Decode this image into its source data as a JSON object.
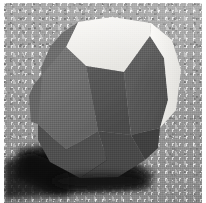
{
  "image": {
    "subject": "polyhedron-model-photograph",
    "description": "Photograph of a gray truncated polyhedron model resting on a speckled granular surface",
    "width": 206,
    "height": 203,
    "border": {
      "color": "#ffffff",
      "left": 4,
      "top": 3,
      "right": 4,
      "bottom": 0
    }
  },
  "background": {
    "name": "speckled-gray-surface",
    "base_color": "#b6b6b6",
    "highlight_color": "#c9c9c9",
    "shadow_color": "#8e8e8e",
    "texture": "granular-speckle"
  },
  "shadow": {
    "name": "cast-shadow",
    "color": "#1a1a1a",
    "soft_color": "#2b2b2b",
    "direction": "lower-left"
  },
  "solid": {
    "name": "truncated-polyhedron",
    "center_x": 104,
    "center_y": 100,
    "faces": [
      {
        "id": "top-hexagon",
        "label": "Top face",
        "color": "#f2f1ee",
        "points": "78,22 112,17 151,23 150,36 124,72 86,66 66,47"
      },
      {
        "id": "upper-left-slope",
        "label": "Upper-left slanted face",
        "color": "#6e6e6e",
        "points": "78,22 66,47 52,66 42,84 41,68 50,47 62,33"
      },
      {
        "id": "left-large-face",
        "label": "Large left face",
        "color": "#717171",
        "points": "66,47 86,66 98,131 66,150 38,124 33,86 42,75"
      },
      {
        "id": "left-edge-strip",
        "label": "Left edge strip",
        "color": "#646464",
        "points": "42,75 33,86 29,96 31,122 38,124"
      },
      {
        "id": "front-square",
        "label": "Front square face",
        "color": "#535353",
        "points": "86,66 124,72 131,135 98,131"
      },
      {
        "id": "right-large-face",
        "label": "Large right face",
        "color": "#5a5a5a",
        "points": "124,72 150,36 164,58 168,100 160,128 131,135"
      },
      {
        "id": "right-bright-face",
        "label": "Bright right face",
        "color": "#f0efec",
        "points": "151,23 150,36 164,58 168,100 160,128 176,110 181,70 172,40"
      },
      {
        "id": "lower-left-facet",
        "label": "Lower-left facet",
        "color": "#4d4d4d",
        "points": "38,124 66,150 98,131 107,160 80,178 50,162 38,140"
      },
      {
        "id": "bottom-facet",
        "label": "Bottom facet",
        "color": "#474747",
        "points": "98,131 131,135 145,160 118,177 80,178 107,160"
      },
      {
        "id": "bottom-right-facet",
        "label": "Bottom-right facet",
        "color": "#3f3f3f",
        "points": "131,135 160,128 158,148 145,160"
      }
    ],
    "highlight_color": "#f2f1ee",
    "midtone_color": "#707070",
    "shade_color": "#4a4a4a"
  }
}
